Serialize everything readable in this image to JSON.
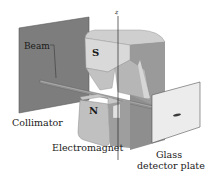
{
  "diagram": {
    "type": "Stern-Gerlach apparatus",
    "labels": {
      "beam": "Beam",
      "collimator": "Collimator",
      "electromagnet": "Electromagnet",
      "glass": "Glass",
      "detector_plate": "detector plate",
      "z_axis": "z"
    },
    "poles": {
      "south": "S",
      "north": "N"
    },
    "colors": {
      "collimator_face": "#7a7a7a",
      "magnet_light": "#d8d8d8",
      "magnet_mid": "#b4b4b4",
      "magnet_dark": "#8c8c8c",
      "plate": "#ececec",
      "beam_line": "#555555",
      "line": "#2a2a2a"
    }
  }
}
